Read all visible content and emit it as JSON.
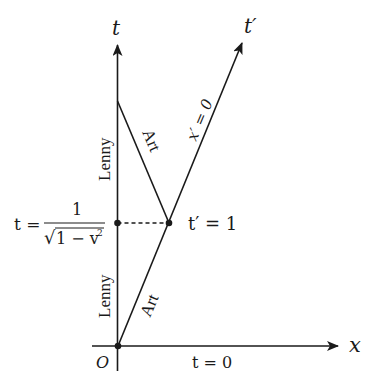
{
  "diagram": {
    "type": "spacetime-diagram",
    "colors": {
      "line": "#1a1a1a",
      "background": "#ffffff"
    },
    "axes": {
      "t_axis": {
        "label": "t"
      },
      "x_axis": {
        "label": "x"
      },
      "t_prime_axis": {
        "label": "t′"
      },
      "origin_label": "O"
    },
    "worldlines": {
      "lenny_upper": "Lenny",
      "lenny_lower": "Lenny",
      "art_outbound": "Art",
      "art_return": "Art"
    },
    "annotations": {
      "x_prime_zero": "x′ = 0",
      "t_prime_one": "t′ = 1",
      "t_zero": "t = 0",
      "t_event_lhs": "t =",
      "t_event_numerator": "1",
      "t_event_denominator": "√1 − v²",
      "t_event_denominator_base": "1 − v",
      "t_event_denominator_exp": "2"
    },
    "points": [
      {
        "name": "origin",
        "x": 118,
        "y": 346
      },
      {
        "name": "lenny-event",
        "x": 117,
        "y": 223
      },
      {
        "name": "art-turnaround",
        "x": 169,
        "y": 223
      }
    ]
  }
}
